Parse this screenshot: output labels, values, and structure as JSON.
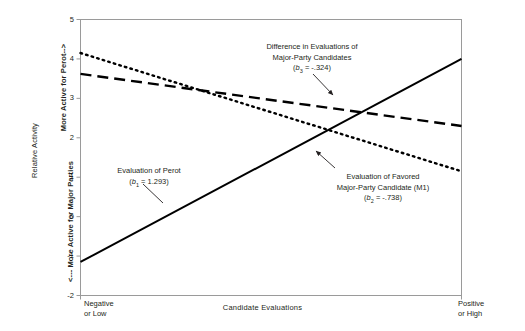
{
  "chart_data": {
    "type": "line",
    "title": "",
    "xlabel": "Candidate Evaluations",
    "ylabel": "Relative Activity",
    "ylabel_inner_top": "More Active for Perot-->",
    "ylabel_inner_bottom": "<--- More Active for Major Parties",
    "xlim": [
      0,
      1
    ],
    "ylim": [
      -2,
      5
    ],
    "grid": false,
    "legend_position": "inline-annotations",
    "xtick_labels": [
      "Negative\nor Low",
      "Positive\nor High"
    ],
    "xtick_left_line1": "Negative",
    "xtick_left_line2": "or Low",
    "xtick_right_line1": "Positive",
    "xtick_right_line2": "or High",
    "ytick_labels": [
      "5",
      "4",
      "3",
      "2",
      "1",
      "0",
      "-1",
      "-2"
    ],
    "ytick_values": [
      5,
      4,
      3,
      2,
      1,
      0,
      -1,
      -2
    ],
    "series": [
      {
        "name": "Evaluation of Perot",
        "style": "solid",
        "coefficient_label": "b1",
        "coefficient_value": "1.293",
        "x": [
          0,
          1
        ],
        "values": [
          -1.15,
          4.0
        ]
      },
      {
        "name": "Difference in Evaluations of Major-Party Candidates",
        "style": "dashed",
        "coefficient_label": "b3",
        "coefficient_value": "-.324",
        "x": [
          0,
          1
        ],
        "values": [
          3.62,
          2.3
        ]
      },
      {
        "name": "Evaluation of Favored Major-Party Candidate (M1)",
        "style": "dotted",
        "coefficient_label": "b2",
        "coefficient_value": "-.738",
        "x": [
          0,
          1
        ],
        "values": [
          4.15,
          1.15
        ]
      }
    ],
    "annotations": [
      {
        "id": "difference",
        "line1": "Difference in Evaluations of",
        "line2": "Major-Party Candidates",
        "coef_open": "(",
        "coef_var": "b",
        "coef_sub": "3",
        "coef_rest": " = -.324)"
      },
      {
        "id": "perot",
        "line1": "Evaluation of  Perot",
        "line2": "",
        "coef_open": "(",
        "coef_var": "b",
        "coef_sub": "1",
        "coef_rest": " = 1.293)"
      },
      {
        "id": "favored",
        "line1": "Evaluation of Favored",
        "line2": "Major-Party Candidate (M1)",
        "coef_open": "(",
        "coef_var": "b",
        "coef_sub": "2",
        "coef_rest": " = -.738)"
      }
    ],
    "colors": {
      "line": "#000000",
      "axis": "#9a9a9a",
      "text": "#231f20",
      "background": "#ffffff"
    }
  }
}
